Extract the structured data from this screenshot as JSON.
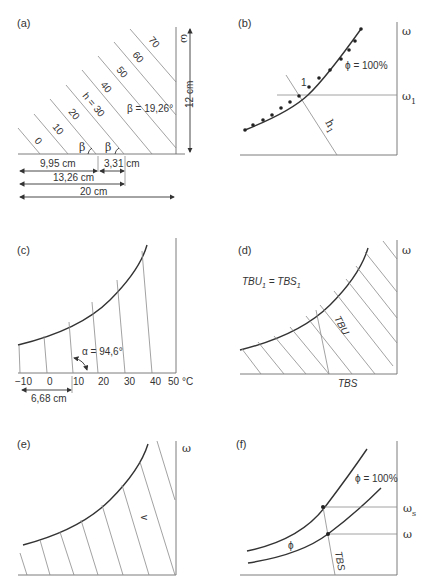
{
  "panels": {
    "a": {
      "label": "(a)",
      "enthalpy_lines": [
        "0",
        "10",
        "20",
        "h = 30",
        "40",
        "50",
        "60",
        "70"
      ],
      "beta_symbol": "β",
      "beta_label": "β = 19,26°",
      "omega": "ω",
      "height_label": "12 cm",
      "dim_1": "9,95 cm",
      "dim_2": "3,31 cm",
      "dim_3": "13,26 cm",
      "dim_4": "20 cm"
    },
    "b": {
      "label": "(b)",
      "omega": "ω",
      "omega1": "ω",
      "omega1_sub": "1",
      "phi_label": "ϕ = 100%",
      "point_label": "1",
      "h1": "h",
      "h1_sub": "1"
    },
    "c": {
      "label": "(c)",
      "alpha_label": "α = 94,6°",
      "ticks": [
        "−10",
        "0",
        "10",
        "20",
        "30",
        "40",
        "50 °C"
      ],
      "dim": "6,68 cm"
    },
    "d": {
      "label": "(d)",
      "omega": "ω",
      "eq_tbu": "TBU",
      "eq_sub1": "1",
      "eq_eq": " = TBS",
      "eq_sub2": "1",
      "tbu": "TBU",
      "tbs": "TBS"
    },
    "e": {
      "label": "(e)",
      "omega": "ω",
      "v_label": "v"
    },
    "f": {
      "label": "(f)",
      "phi100": "ϕ = 100%",
      "phi": "ϕ",
      "omega_s": "ω",
      "omega_s_sub": "s",
      "omega": "ω",
      "tbs": "TBS"
    }
  }
}
